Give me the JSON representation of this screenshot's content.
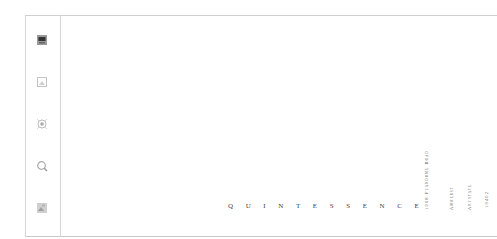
{
  "sidebar": {
    "icons": [
      {
        "name": "photo-icon",
        "state": "active"
      },
      {
        "name": "image-icon",
        "state": "inactive"
      },
      {
        "name": "target-icon",
        "state": "inactive"
      },
      {
        "name": "search-icon",
        "state": "inactive"
      },
      {
        "name": "gallery-icon",
        "state": "inactive"
      }
    ]
  },
  "main": {
    "brand": "QUINTESSENCE",
    "address": {
      "street": "1068 Plandome Road",
      "city": "Amherst",
      "state": "Anystate",
      "zip": "19402"
    }
  },
  "colors": {
    "border": "#d6d6d6",
    "text": "#444444",
    "background": "#ffffff"
  }
}
